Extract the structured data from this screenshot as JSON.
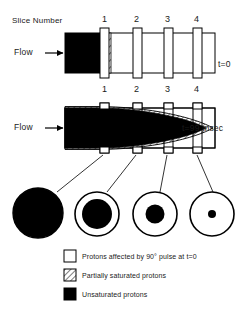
{
  "figure": {
    "type": "diagram",
    "background_color": "#ffffff",
    "ink_color": "#000000"
  },
  "labels": {
    "slice_number": "Slice Number",
    "flow": "Flow",
    "flow_arrow": "arrow-right-icon",
    "time_initial": "t=0",
    "time_later": "t=99 msec"
  },
  "slices": {
    "top_row": [
      "1",
      "2",
      "3",
      "4"
    ],
    "bottom_row": [
      "1",
      "2",
      "3",
      "4"
    ]
  },
  "panels": [
    {
      "name": "panel-t0",
      "time": "t=0",
      "description": "Tube with unsaturated bolus entering and slice 1 partially saturated"
    },
    {
      "name": "panel-t99",
      "time": "t=99 msec",
      "description": "Parabolic laminar flow profile of unsaturated protons reaching slice 4"
    }
  ],
  "cross_sections": [
    {
      "name": "cross-section-1",
      "slice": "1",
      "core_fill": "unsaturated",
      "core_fraction": 1.0
    },
    {
      "name": "cross-section-2",
      "slice": "2",
      "core_fill": "unsaturated",
      "core_fraction": 0.68
    },
    {
      "name": "cross-section-3",
      "slice": "3",
      "core_fill": "unsaturated",
      "core_fraction": 0.42
    },
    {
      "name": "cross-section-4",
      "slice": "4",
      "core_fill": "unsaturated",
      "core_fraction": 0.17
    }
  ],
  "legend": {
    "items": [
      {
        "swatch": "open",
        "text_before": "Protons affected by 90",
        "degree": "°",
        "text_after": " pulse at t=0",
        "full": "Protons affected by 90° pulse at t=0"
      },
      {
        "swatch": "hatched",
        "text_before": "Partially saturated protons",
        "degree": "",
        "text_after": "",
        "full": "Partially saturated protons"
      },
      {
        "swatch": "filled",
        "text_before": "Unsaturated protons",
        "degree": "",
        "text_after": "",
        "full": "Unsaturated protons"
      }
    ]
  },
  "colors": {
    "ink": "#000000",
    "paper": "#ffffff"
  }
}
